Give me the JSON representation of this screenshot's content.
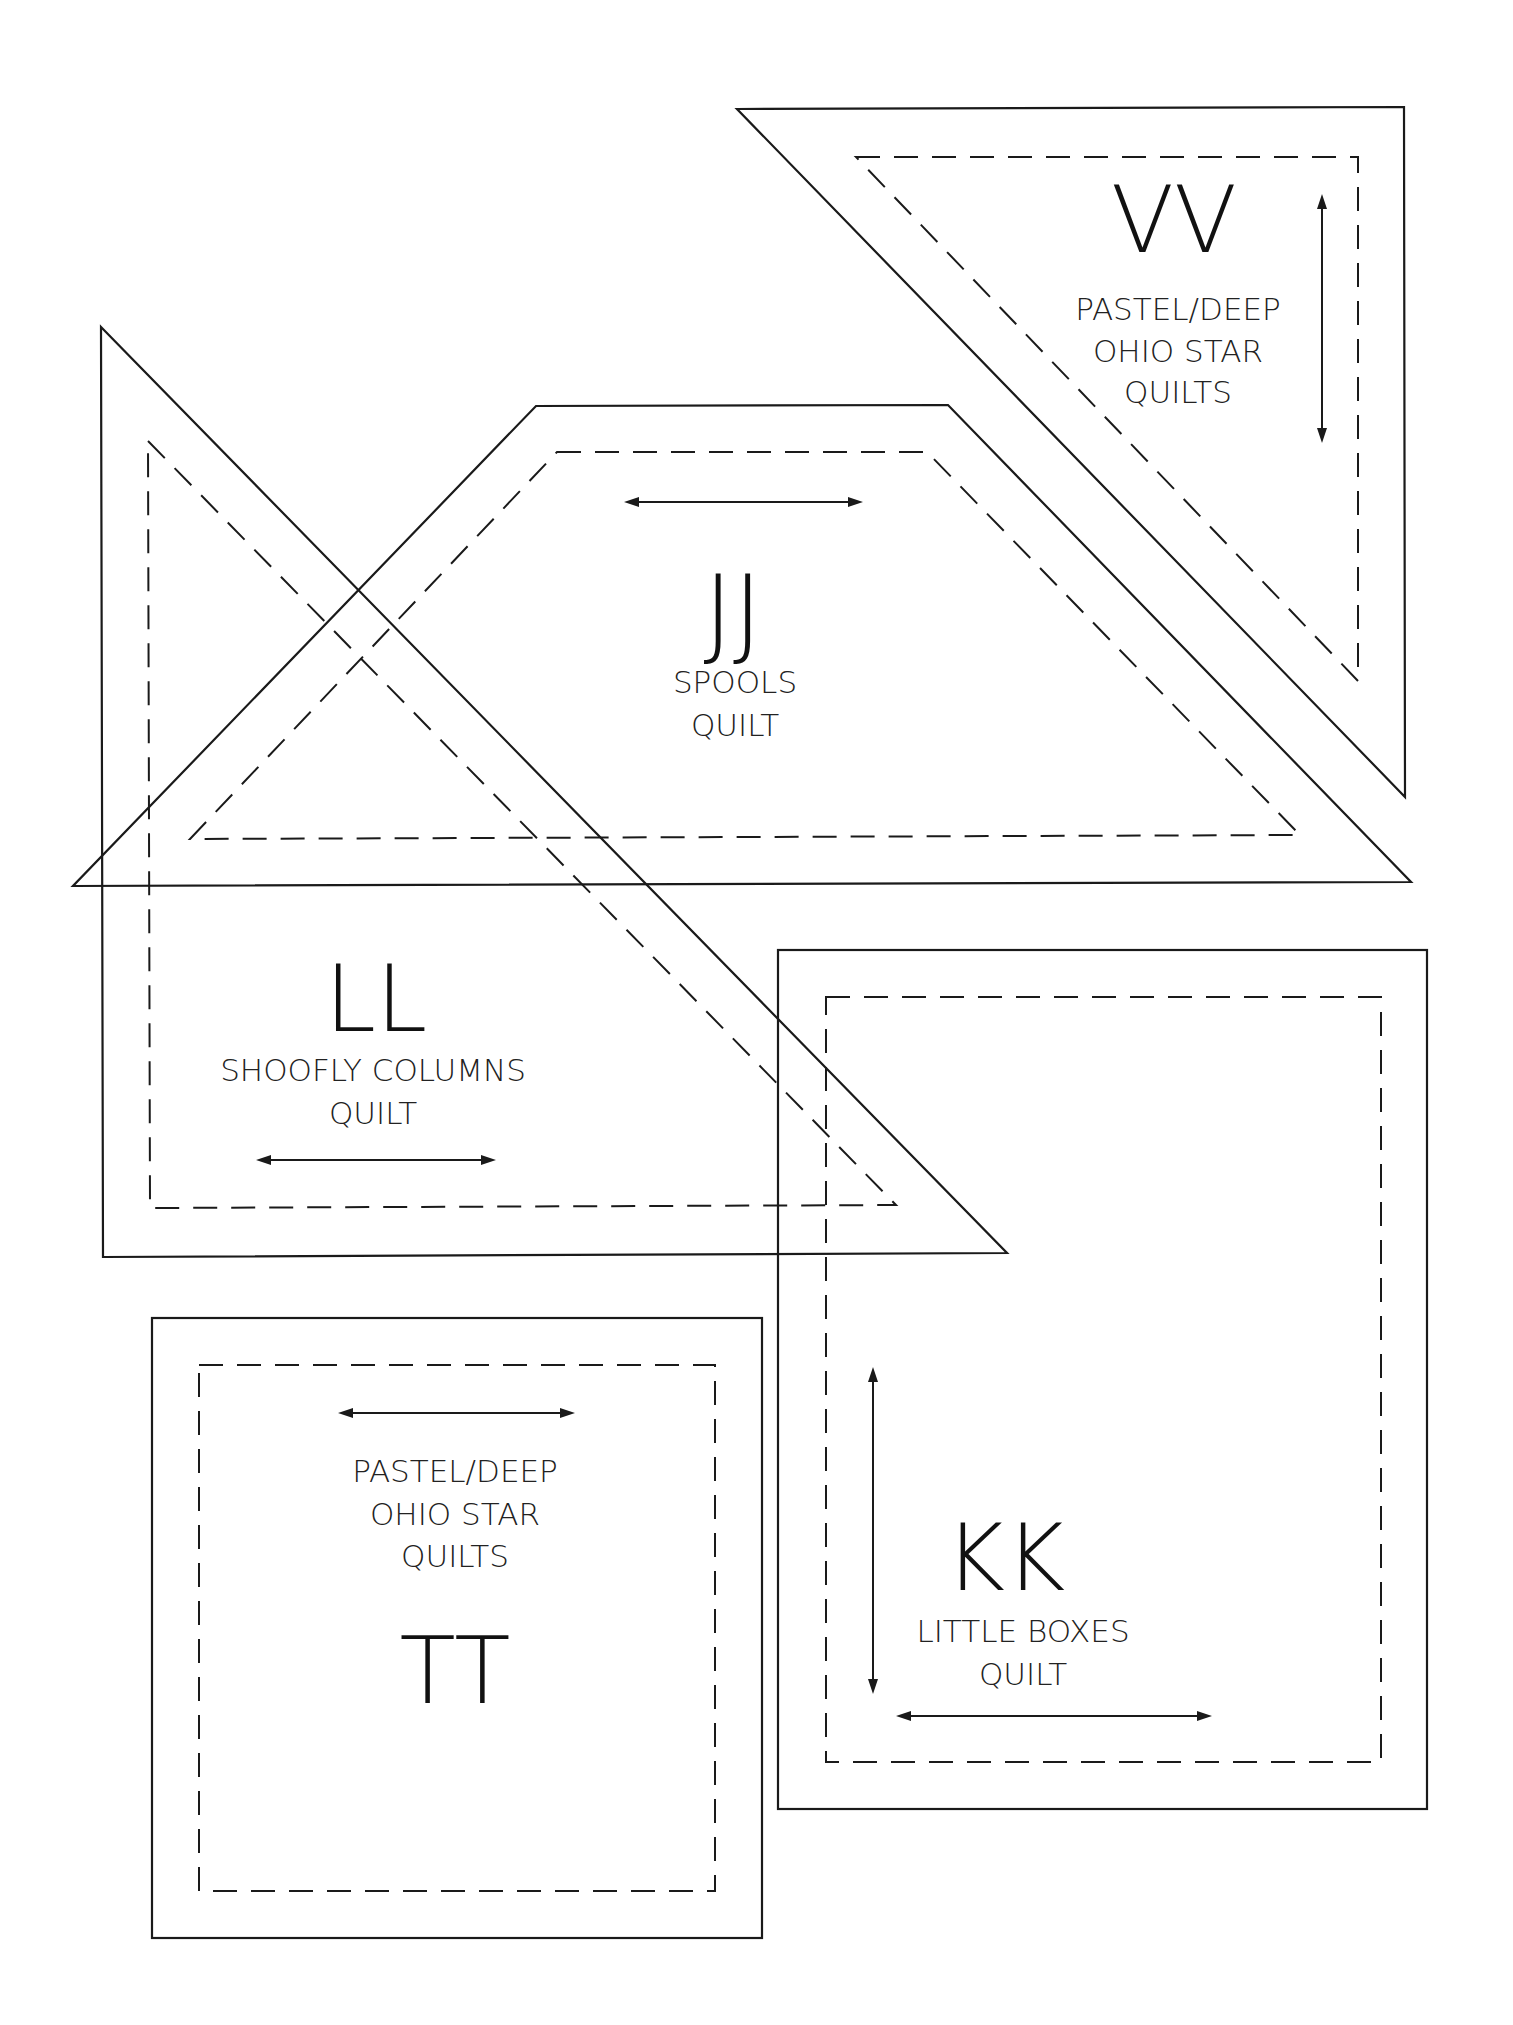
{
  "page": {
    "background": "#ffffff",
    "line_color": "#1a1a1a"
  },
  "templates": [
    {
      "id": "VV",
      "letter": "VV",
      "caption_lines": [
        "PASTEL/DEEP",
        "OHIO STAR",
        "QUILTS"
      ],
      "shape": "right-triangle",
      "grain_arrow": "vertical"
    },
    {
      "id": "JJ",
      "letter": "JJ",
      "caption_lines": [
        "SPOOLS",
        "QUILT"
      ],
      "shape": "trapezoid",
      "grain_arrow": "horizontal"
    },
    {
      "id": "LL",
      "letter": "LL",
      "caption_lines": [
        "SHOOFLY COLUMNS",
        "QUILT"
      ],
      "shape": "right-triangle",
      "grain_arrow": "horizontal"
    },
    {
      "id": "KK",
      "letter": "KK",
      "caption_lines": [
        "LITTLE BOXES",
        "QUILT"
      ],
      "shape": "rectangle",
      "grain_arrow": "both"
    },
    {
      "id": "TT",
      "letter": "TT",
      "caption_lines": [
        "PASTEL/DEEP",
        "OHIO STAR",
        "QUILTS"
      ],
      "shape": "square",
      "grain_arrow": "horizontal"
    }
  ]
}
